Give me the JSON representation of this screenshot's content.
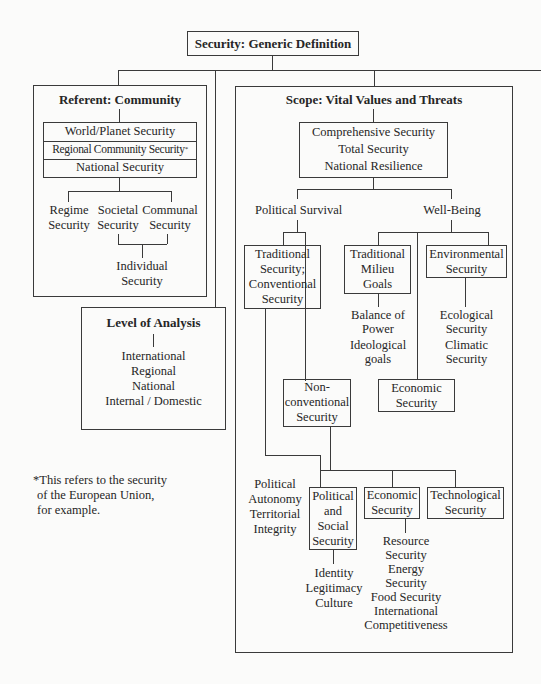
{
  "title": "Security: Generic Definition",
  "referent": {
    "heading": "Referent: Community",
    "stack": [
      "World/Planet Security",
      "Regional Community Security",
      "National Security"
    ],
    "stack_footnote_mark": "*",
    "branches": [
      {
        "line1": "Regime",
        "line2": "Security"
      },
      {
        "line1": "Societal",
        "line2": "Security"
      },
      {
        "line1": "Communal",
        "line2": "Security"
      }
    ],
    "individual": {
      "line1": "Individual",
      "line2": "Security"
    }
  },
  "level_of_analysis": {
    "heading": "Level of Analysis",
    "items": [
      "International",
      "Regional",
      "National",
      "Internal / Domestic"
    ]
  },
  "footnote": {
    "lines": [
      "*This refers to the security",
      "of the European Union,",
      "for example."
    ]
  },
  "scope": {
    "heading": "Scope: Vital Values and Threats",
    "comprehensive": [
      "Comprehensive Security",
      "Total Security",
      "National Resilience"
    ],
    "political_survival": "Political Survival",
    "well_being": "Well-Being",
    "traditional_security": [
      "Traditional",
      "Security;",
      "Conventional",
      "Security"
    ],
    "traditional_milieu": [
      "Traditional",
      "Milieu",
      "Goals"
    ],
    "milieu_items": [
      "Balance of",
      "Power",
      "Ideological",
      "goals"
    ],
    "environmental": [
      "Environmental",
      "Security"
    ],
    "environmental_items": [
      "Ecological",
      "Security",
      "Climatic",
      "Security"
    ],
    "non_conventional": [
      "Non-",
      "conventional",
      "Security"
    ],
    "economic_upper": [
      "Economic",
      "Security"
    ],
    "political_autonomy": [
      "Political",
      "Autonomy",
      "Territorial",
      "Integrity"
    ],
    "political_social": [
      "Political",
      "and",
      "Social",
      "Security"
    ],
    "political_social_items": [
      "Identity",
      "Legitimacy",
      "Culture"
    ],
    "economic_lower": [
      "Economic",
      "Security"
    ],
    "economic_items": [
      "Resource",
      "Security",
      "Energy",
      "Security",
      "Food Security",
      "International",
      "Competitiveness"
    ],
    "technological": [
      "Technological",
      "Security"
    ]
  }
}
